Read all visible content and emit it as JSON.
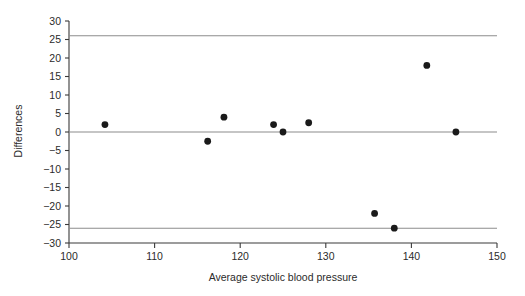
{
  "chart_data": {
    "type": "scatter",
    "title": "",
    "subtitle": "",
    "xlabel": "Average systolic blood pressure",
    "ylabel": "Differences",
    "xlim": [
      100,
      150
    ],
    "ylim": [
      -30,
      30
    ],
    "xticks": [
      100,
      110,
      120,
      130,
      140,
      150
    ],
    "xticklabels": [
      "100",
      "110",
      "120",
      "130",
      "140",
      "150"
    ],
    "yticks": [
      -30,
      -25,
      -20,
      -15,
      -10,
      -5,
      0,
      5,
      10,
      15,
      20,
      25,
      30
    ],
    "yticklabels": [
      "30",
      "25",
      "20",
      "15",
      "10",
      "5",
      "0",
      "−5",
      "−10",
      "−15",
      "−20",
      "−25",
      "−30"
    ],
    "grid": false,
    "legend": null,
    "x": [
      104.2,
      116.2,
      118.1,
      123.9,
      125.0,
      128.0,
      135.7,
      138.0,
      141.8,
      145.2
    ],
    "y": [
      2.0,
      -2.5,
      4.0,
      2.0,
      0.0,
      2.5,
      -22.0,
      -26.0,
      18.0,
      0.0
    ],
    "points": [
      {
        "x": 104.2,
        "y": 2.0
      },
      {
        "x": 116.2,
        "y": -2.5
      },
      {
        "x": 118.1,
        "y": 4.0
      },
      {
        "x": 123.9,
        "y": 2.0
      },
      {
        "x": 125.0,
        "y": 0.0
      },
      {
        "x": 128.0,
        "y": 2.5
      },
      {
        "x": 135.7,
        "y": -22.0
      },
      {
        "x": 138.0,
        "y": -26.0
      },
      {
        "x": 141.8,
        "y": 18.0
      },
      {
        "x": 145.2,
        "y": 0.0
      }
    ],
    "reference_lines": [
      {
        "name": "upper-limit-of-agreement",
        "value": 26.0,
        "orientation": "horizontal"
      },
      {
        "name": "mean-difference",
        "value": 0.0,
        "orientation": "horizontal"
      },
      {
        "name": "lower-limit-of-agreement",
        "value": -26.0,
        "orientation": "horizontal"
      }
    ],
    "colors": {
      "point": "#1a1a1a",
      "axis": "#3a3a3a",
      "reference_line": "#8c8c8c",
      "background": "#ffffff",
      "text": "#2b2b2b"
    }
  }
}
